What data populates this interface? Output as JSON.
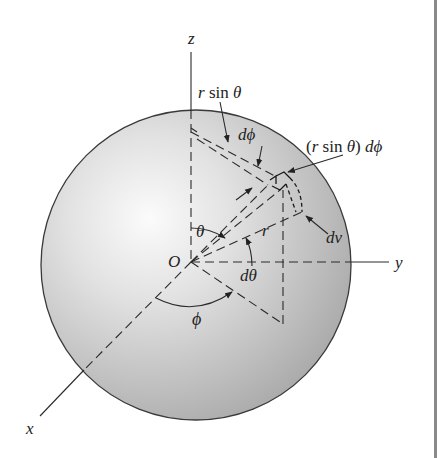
{
  "figure": {
    "colors": {
      "sphere_light": "#f7f7f7",
      "sphere_dark": "#a9a9a9",
      "outline": "#3a3a3a",
      "line": "#2a2a2a",
      "edge_bar": "#8a8a8a"
    },
    "axes": {
      "x": "x",
      "y": "y",
      "z": "z"
    },
    "origin_label": "O",
    "labels": {
      "r_sin_theta": {
        "pre": "r ",
        "fn": "sin",
        "post": " θ"
      },
      "d_phi": "dϕ",
      "r_sin_theta_dphi": {
        "open": "(",
        "pre": "r ",
        "fn": "sin",
        "post": " θ",
        "close": ")",
        "tail": " dϕ"
      },
      "dv": "dv",
      "r": "r",
      "theta": "θ",
      "d_theta": "dθ",
      "phi": "ϕ"
    }
  }
}
